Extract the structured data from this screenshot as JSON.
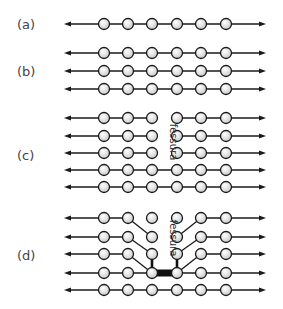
{
  "figure": {
    "crack_label": "fessura",
    "colors": {
      "line": "#1a1a1a",
      "atom_fill_center": "#ffffff",
      "atom_fill_edge": "#c8c8c8",
      "label": "#444444"
    },
    "geometry": {
      "arrow_left_x": 64,
      "arrow_right_x": 266,
      "atom_x": [
        104,
        128,
        152,
        177,
        201,
        226
      ],
      "atom_radius": 5.5
    },
    "panels": [
      {
        "id": "a",
        "label": "(a)",
        "label_y": 29,
        "rows_y": [
          24
        ],
        "state": "single row of atoms, fully bonded"
      },
      {
        "id": "b",
        "label": "(b)",
        "label_y": 76,
        "rows_y": [
          53,
          71,
          89
        ],
        "state": "three rows of atoms, fully bonded"
      },
      {
        "id": "c",
        "label": "(c)",
        "label_y": 160,
        "rows_y": [
          118,
          136,
          153,
          170,
          187
        ],
        "state": "crack separates atoms 3 and 4 in top three rows",
        "broken_rows": [
          0,
          1,
          2
        ]
      },
      {
        "id": "d",
        "label": "(d)",
        "label_y": 260,
        "rows_y": [
          218,
          237,
          254,
          273,
          290
        ],
        "state": "crack propagates; bonds redirect diagonally; strong bond at crack tip"
      }
    ]
  }
}
